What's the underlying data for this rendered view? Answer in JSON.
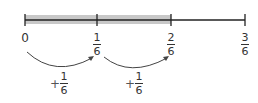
{
  "number_line": {
    "shaded_from": 0,
    "shaded_to": 2,
    "shade_color": "#c8c8c8",
    "line_color": "#222222",
    "ticks": [
      {
        "label_whole": "0",
        "num": null,
        "den": null
      },
      {
        "label_whole": null,
        "num": "1",
        "den": "6"
      },
      {
        "label_whole": null,
        "num": "2",
        "den": "6"
      },
      {
        "label_whole": null,
        "num": "3",
        "den": "6"
      }
    ]
  },
  "jumps": [
    {
      "sign": "+",
      "num": "1",
      "den": "6"
    },
    {
      "sign": "+",
      "num": "1",
      "den": "6"
    }
  ]
}
